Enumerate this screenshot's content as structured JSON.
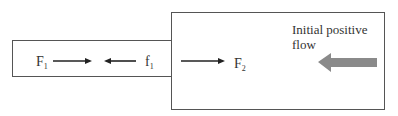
{
  "diagram": {
    "labels": {
      "F1": {
        "base": "F",
        "sub": "1"
      },
      "f1": {
        "base": "f",
        "sub": "1"
      },
      "F2": {
        "base": "F",
        "sub": "2"
      }
    },
    "annotation": {
      "line1": "Initial positive",
      "line2": "flow"
    },
    "colors": {
      "box_border": "#555555",
      "force_arrow": "#222222",
      "flow_arrow": "#8a8a8a"
    },
    "arrows": [
      {
        "name": "F1",
        "direction": "right"
      },
      {
        "name": "f1",
        "direction": "left"
      },
      {
        "name": "F2",
        "direction": "right"
      },
      {
        "name": "initial-positive-flow",
        "direction": "left",
        "style": "thick-gray"
      }
    ]
  }
}
